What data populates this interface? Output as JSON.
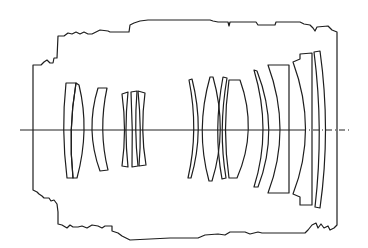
{
  "diagram": {
    "type": "lens-schematic",
    "optical_axis": {
      "y": 130,
      "x_start": 20,
      "x_end": 352
    },
    "barrel": {
      "left_x": 33,
      "right_x": 337,
      "top_y": 20,
      "bottom_y": 240
    },
    "lens_groups": [
      {
        "name": "front-group",
        "element_count": 3
      },
      {
        "name": "second-group",
        "element_count": 3
      },
      {
        "name": "middle-group",
        "element_count": 4
      },
      {
        "name": "rear-group",
        "element_count": 4
      }
    ],
    "colors": {
      "line": "#1e1e1e",
      "background": "#ffffff"
    }
  }
}
